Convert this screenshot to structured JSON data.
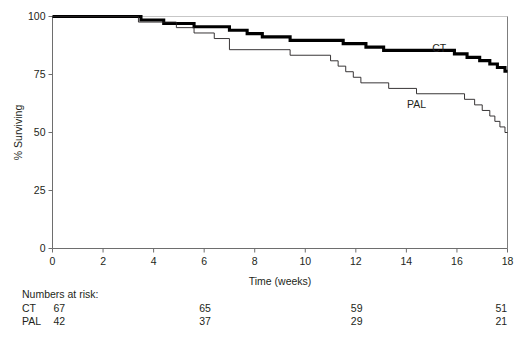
{
  "chart_data": {
    "type": "line",
    "subtype": "kaplan-meier-step",
    "title": "",
    "xlabel": "Time (weeks)",
    "ylabel": "% Surviving",
    "xlim": [
      0,
      18
    ],
    "ylim": [
      0,
      100
    ],
    "xticks": [
      0,
      2,
      4,
      6,
      8,
      10,
      12,
      14,
      16,
      18
    ],
    "xticklabels": [
      "0",
      "2",
      "4",
      "6",
      "8",
      "10",
      "12",
      "14",
      "16",
      "18"
    ],
    "yticks": [
      0,
      25,
      50,
      75,
      100
    ],
    "yticklabels": [
      "0",
      "25",
      "50",
      "75",
      "100"
    ],
    "grid": false,
    "legend_position": "inline-annotation",
    "series": [
      {
        "name": "CT",
        "label": "CT",
        "color": "#000000",
        "line_width": 3.1,
        "annotation": {
          "text": "CT",
          "x": 15.3,
          "y": 84.5
        },
        "points": [
          [
            0.0,
            100.0
          ],
          [
            3.5,
            100.0
          ],
          [
            3.5,
            98.5
          ],
          [
            4.4,
            98.5
          ],
          [
            4.4,
            97.0
          ],
          [
            5.6,
            97.0
          ],
          [
            5.6,
            95.6
          ],
          [
            7.0,
            95.6
          ],
          [
            7.0,
            94.1
          ],
          [
            7.7,
            94.1
          ],
          [
            7.7,
            92.6
          ],
          [
            8.3,
            92.6
          ],
          [
            8.3,
            91.2
          ],
          [
            9.4,
            91.2
          ],
          [
            9.4,
            89.7
          ],
          [
            11.5,
            89.7
          ],
          [
            11.5,
            88.3
          ],
          [
            12.4,
            88.3
          ],
          [
            12.4,
            86.8
          ],
          [
            13.1,
            86.8
          ],
          [
            13.1,
            85.4
          ],
          [
            15.9,
            85.4
          ],
          [
            15.9,
            83.9
          ],
          [
            16.4,
            83.9
          ],
          [
            16.4,
            82.4
          ],
          [
            16.9,
            82.4
          ],
          [
            16.9,
            81.0
          ],
          [
            17.3,
            81.0
          ],
          [
            17.3,
            79.5
          ],
          [
            17.6,
            79.5
          ],
          [
            17.6,
            78.0
          ],
          [
            17.9,
            78.0
          ],
          [
            17.9,
            76.4
          ],
          [
            18.0,
            76.4
          ]
        ]
      },
      {
        "name": "PAL",
        "label": "PAL",
        "color": "#231f20",
        "line_width": 0.9,
        "annotation": {
          "text": "PAL",
          "x": 14.4,
          "y": 60.5
        },
        "points": [
          [
            0.0,
            100.0
          ],
          [
            3.4,
            100.0
          ],
          [
            3.4,
            97.6
          ],
          [
            4.9,
            97.6
          ],
          [
            4.9,
            95.2
          ],
          [
            5.6,
            95.2
          ],
          [
            5.6,
            92.9
          ],
          [
            6.4,
            92.9
          ],
          [
            6.4,
            90.5
          ],
          [
            7.0,
            90.5
          ],
          [
            7.0,
            85.7
          ],
          [
            9.4,
            85.7
          ],
          [
            9.4,
            83.3
          ],
          [
            11.0,
            83.3
          ],
          [
            11.0,
            80.9
          ],
          [
            11.3,
            80.9
          ],
          [
            11.3,
            78.6
          ],
          [
            11.6,
            78.6
          ],
          [
            11.6,
            76.2
          ],
          [
            11.9,
            76.2
          ],
          [
            11.9,
            73.8
          ],
          [
            12.2,
            73.8
          ],
          [
            12.2,
            71.4
          ],
          [
            13.3,
            71.4
          ],
          [
            13.3,
            69.0
          ],
          [
            14.4,
            69.0
          ],
          [
            14.4,
            66.7
          ],
          [
            16.3,
            66.7
          ],
          [
            16.3,
            64.3
          ],
          [
            16.7,
            64.3
          ],
          [
            16.7,
            61.9
          ],
          [
            17.0,
            61.9
          ],
          [
            17.0,
            59.5
          ],
          [
            17.3,
            59.5
          ],
          [
            17.3,
            57.1
          ],
          [
            17.5,
            57.1
          ],
          [
            17.5,
            54.8
          ],
          [
            17.7,
            54.8
          ],
          [
            17.7,
            52.4
          ],
          [
            17.9,
            52.4
          ],
          [
            17.9,
            50.0
          ],
          [
            18.0,
            50.0
          ]
        ]
      }
    ],
    "numbers_at_risk": {
      "title": "Numbers at risk:",
      "times": [
        0,
        6,
        12,
        18
      ],
      "rows": [
        {
          "name": "CT",
          "values": [
            "67",
            "65",
            "59",
            "51"
          ]
        },
        {
          "name": "PAL",
          "values": [
            "42",
            "37",
            "29",
            "21"
          ]
        }
      ]
    }
  }
}
